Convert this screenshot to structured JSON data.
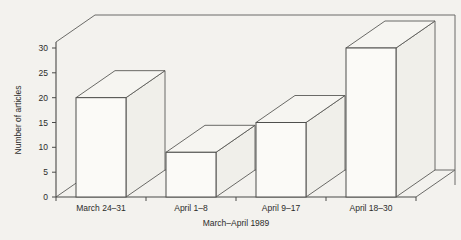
{
  "chart_data": {
    "type": "bar",
    "title": "",
    "xlabel": "March–April 1989",
    "ylabel": "Number of articles",
    "categories": [
      "March 24–31",
      "April 1–8",
      "April 9–17",
      "April 18–30"
    ],
    "values": [
      20,
      9,
      15,
      30
    ],
    "series": [
      {
        "name": "Number of articles",
        "values": [
          20,
          9,
          15,
          30
        ]
      }
    ],
    "ylim": [
      0,
      33
    ],
    "ytick_labels": [
      "0",
      "5",
      "10",
      "15",
      "20",
      "25",
      "30"
    ],
    "ytick_values": [
      0,
      5,
      10,
      15,
      20,
      25,
      30
    ],
    "grid": false,
    "legend": false,
    "style": "3d-bar",
    "colors": {
      "background": "#f3f2ee",
      "bar_face": "#fbfaf7",
      "bar_top": "#f6f5f1",
      "bar_side": "#f0efea",
      "line": "#4a4a48",
      "text": "#2c2c2a"
    }
  }
}
